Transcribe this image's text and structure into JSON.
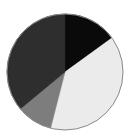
{
  "chart_data": {
    "type": "pie",
    "title": "",
    "start_angle": "top",
    "direction": "clockwise",
    "slices": [
      {
        "label": "",
        "value": 15,
        "color": "#0a0a0a"
      },
      {
        "label": "",
        "value": 39,
        "color": "#ebebeb"
      },
      {
        "label": "",
        "value": 10,
        "color": "#7d7d7d"
      },
      {
        "label": "",
        "value": 36,
        "color": "#2e2e2e"
      }
    ],
    "edge_color": "#8a8a8a",
    "legend": "none"
  }
}
